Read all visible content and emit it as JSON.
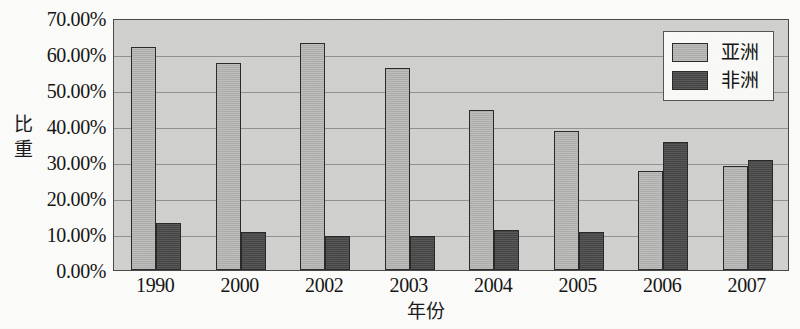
{
  "chart_data": {
    "type": "bar",
    "title": "",
    "subtitle": "",
    "xlabel": "年份",
    "ylabel": "比重",
    "categories": [
      "1990",
      "2000",
      "2002",
      "2003",
      "2004",
      "2005",
      "2006",
      "2007"
    ],
    "series": [
      {
        "name": "亚洲",
        "color": "#b4b4b2",
        "values": [
          62.0,
          57.5,
          63.0,
          56.0,
          44.5,
          38.5,
          27.5,
          29.0
        ]
      },
      {
        "name": "非洲",
        "color": "#4d4d4d",
        "values": [
          13.0,
          10.5,
          9.5,
          9.5,
          11.0,
          10.5,
          35.5,
          30.5
        ]
      }
    ],
    "ylim": [
      0,
      70
    ],
    "ytick_values": [
      70,
      60,
      50,
      40,
      30,
      20,
      10,
      0
    ],
    "ytick_labels": [
      "70.00%",
      "60.00%",
      "50.00%",
      "40.00%",
      "30.00%",
      "20.00%",
      "10.00%",
      "0.00%"
    ],
    "grid": true,
    "grid_axis": "y",
    "legend_position": "top-right",
    "legend_entries": [
      "亚洲",
      "非洲"
    ],
    "plot_background": "#d2d2d0",
    "axis_color": "#4a4a4a"
  }
}
